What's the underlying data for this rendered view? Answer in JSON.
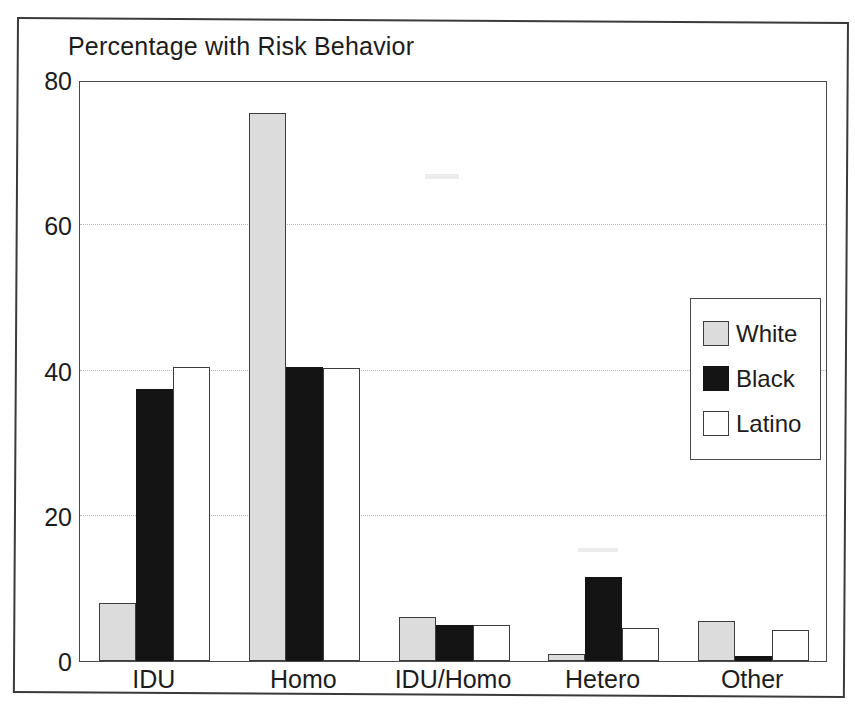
{
  "chart_data": {
    "type": "bar",
    "title": "Percentage with Risk Behavior",
    "xlabel": "",
    "ylabel": "",
    "ylim": [
      0,
      80
    ],
    "yticks": [
      0,
      20,
      40,
      60,
      80
    ],
    "grid": true,
    "legend_position": "inside-top-right",
    "categories": [
      "IDU",
      "Homo",
      "IDU/Homo",
      "Hetero",
      "Other"
    ],
    "series": [
      {
        "name": "White",
        "color": "#dcdcdc",
        "values": [
          8,
          75.5,
          6,
          1,
          5.5
        ]
      },
      {
        "name": "Black",
        "color": "#141414",
        "values": [
          37.5,
          40.5,
          5,
          11.5,
          0.7
        ]
      },
      {
        "name": "Latino",
        "color": "#ffffff",
        "values": [
          40.5,
          40.3,
          5,
          4.5,
          4.3
        ]
      }
    ]
  },
  "legend": {
    "items": [
      {
        "label": "White",
        "swatch": "swatch-white"
      },
      {
        "label": "Black",
        "swatch": "swatch-black"
      },
      {
        "label": "Latino",
        "swatch": "swatch-latino"
      }
    ]
  },
  "axis": {
    "y_tick_labels": [
      "80",
      "60",
      "40",
      "20",
      "0"
    ],
    "x_tick_labels": [
      "IDU",
      "Homo",
      "IDU/Homo",
      "Hetero",
      "Other"
    ]
  }
}
